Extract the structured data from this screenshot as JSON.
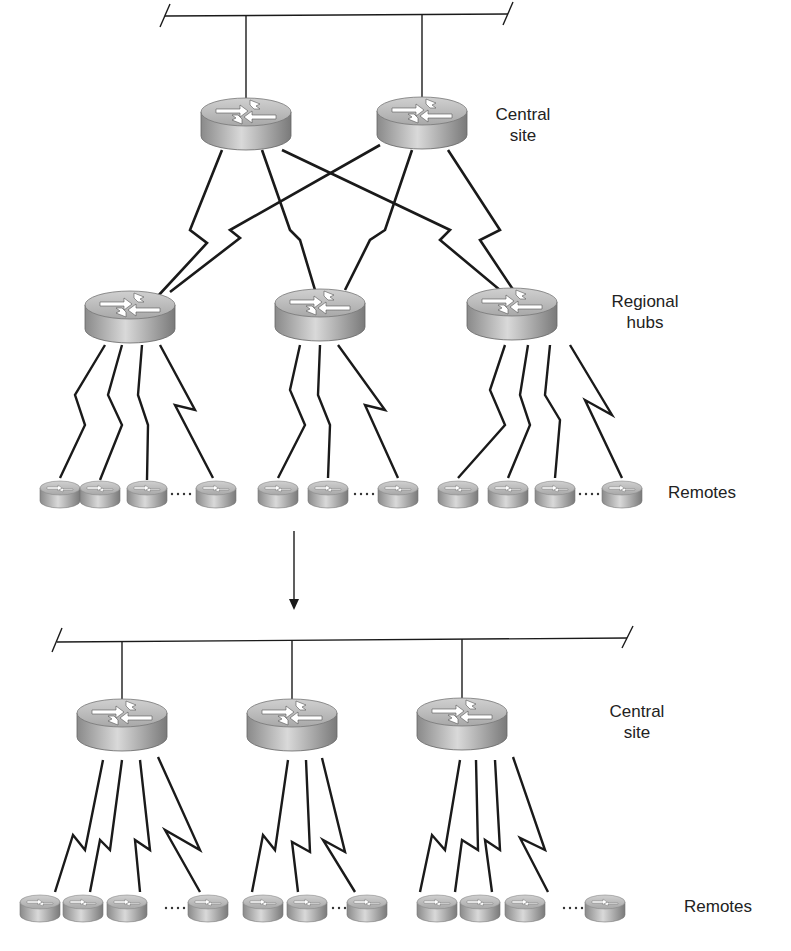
{
  "diagram": {
    "type": "network-topology-migration",
    "top": {
      "central_site_label": "Central\nsite",
      "regional_hubs_label": "Regional\nhubs",
      "remotes_label": "Remotes",
      "central_routers": 2,
      "regional_hubs": 3,
      "remotes_per_hub": [
        4,
        3,
        4
      ]
    },
    "transition_arrow": "down-arrow",
    "bottom": {
      "central_site_label": "Central\nsite",
      "remotes_label": "Remotes",
      "central_routers": 3,
      "remotes_per_router": [
        4,
        3,
        4
      ]
    },
    "colors": {
      "line": "#1a1a1a",
      "router_top": "#c8c8c8",
      "router_side": "#9a9a9a",
      "text": "#222222"
    }
  }
}
